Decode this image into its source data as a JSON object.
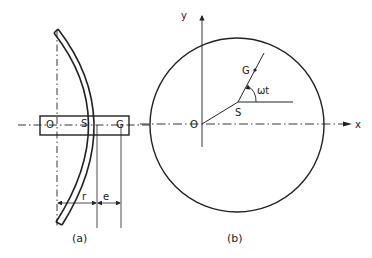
{
  "figure": {
    "panel_a": {
      "caption": "(a)",
      "labels": {
        "O": "O",
        "S": "S",
        "G": "G",
        "r": "r",
        "e": "e"
      }
    },
    "panel_b": {
      "caption": "(b)",
      "labels": {
        "O": "O",
        "S": "S",
        "G": "G",
        "x": "x",
        "y": "y",
        "angle": "ωt"
      }
    },
    "colors": {
      "ink": "#222222",
      "background": "#ffffff"
    }
  }
}
